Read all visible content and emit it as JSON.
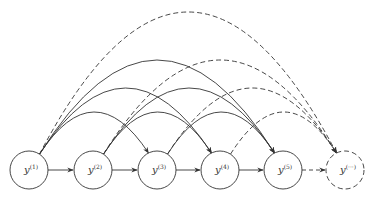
{
  "diagram": {
    "type": "dependency-graph",
    "stroke_color": "#333333",
    "nodes": [
      {
        "id": "y1",
        "label": "y",
        "sup": "(1)",
        "cx": 29,
        "dashed": false
      },
      {
        "id": "y2",
        "label": "y",
        "sup": "(2)",
        "cx": 93,
        "dashed": false
      },
      {
        "id": "y3",
        "label": "y",
        "sup": "(3)",
        "cx": 157,
        "dashed": false
      },
      {
        "id": "y4",
        "label": "y",
        "sup": "(4)",
        "cx": 220,
        "dashed": false
      },
      {
        "id": "y5",
        "label": "y",
        "sup": "(5)",
        "cx": 283,
        "dashed": false
      },
      {
        "id": "ydots",
        "label": "y",
        "sup": "(···)",
        "cx": 345,
        "dashed": true
      }
    ],
    "node_cy": 170,
    "node_r": 19,
    "straight_edges": [
      {
        "from": "y1",
        "to": "y2",
        "dashed": false
      },
      {
        "from": "y2",
        "to": "y3",
        "dashed": false
      },
      {
        "from": "y3",
        "to": "y4",
        "dashed": false
      },
      {
        "from": "y4",
        "to": "y5",
        "dashed": false
      },
      {
        "from": "y5",
        "to": "ydots",
        "dashed": true
      }
    ],
    "arc_edges": [
      {
        "from": "y1",
        "to": "y3",
        "dashed": false,
        "apex": 112
      },
      {
        "from": "y1",
        "to": "y4",
        "dashed": false,
        "apex": 88
      },
      {
        "from": "y1",
        "to": "y5",
        "dashed": false,
        "apex": 60
      },
      {
        "from": "y1",
        "to": "ydots",
        "dashed": true,
        "apex": 12
      },
      {
        "from": "y2",
        "to": "y4",
        "dashed": false,
        "apex": 112
      },
      {
        "from": "y2",
        "to": "y5",
        "dashed": false,
        "apex": 88
      },
      {
        "from": "y2",
        "to": "ydots",
        "dashed": true,
        "apex": 60
      },
      {
        "from": "y3",
        "to": "y5",
        "dashed": false,
        "apex": 112
      },
      {
        "from": "y3",
        "to": "ydots",
        "dashed": true,
        "apex": 88
      },
      {
        "from": "y4",
        "to": "ydots",
        "dashed": true,
        "apex": 112
      }
    ]
  }
}
